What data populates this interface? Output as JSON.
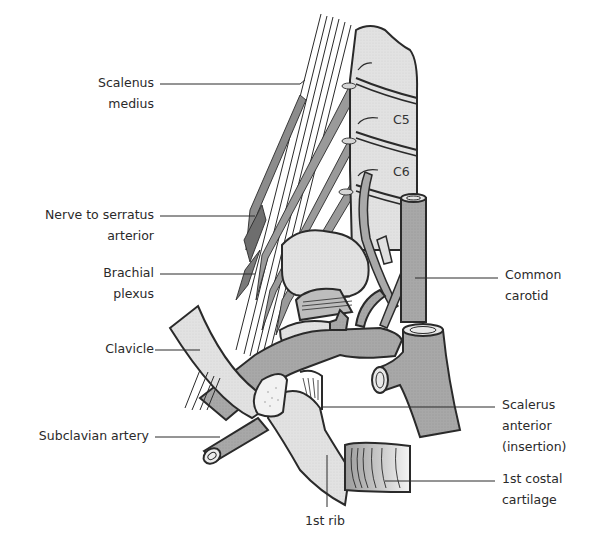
{
  "figure": {
    "type": "anatomical-illustration",
    "colors": {
      "background": "#ffffff",
      "outline": "#2a2a2a",
      "bone_fill": "#e3e3e3",
      "vessel_fill": "#a9a9a9",
      "muscle_fill": "#c8c8c8",
      "text": "#2a2a2a"
    }
  },
  "vertebra_labels": {
    "c5": "C5",
    "c6": "C6"
  },
  "labels_left": [
    {
      "id": "scalenus-medius",
      "lines": [
        "Scalenus",
        "medius"
      ]
    },
    {
      "id": "nerve-to-serratus",
      "lines": [
        "Nerve to serratus",
        "arterior"
      ]
    },
    {
      "id": "brachial-plexus",
      "lines": [
        "Brachial",
        "plexus"
      ]
    },
    {
      "id": "clavicle",
      "lines": [
        "Clavicle"
      ]
    },
    {
      "id": "subclavian-artery",
      "lines": [
        "Subclavian artery"
      ]
    }
  ],
  "labels_right": [
    {
      "id": "common-carotid",
      "lines": [
        "Common",
        "carotid"
      ]
    },
    {
      "id": "scalenus-anterior",
      "lines": [
        "Scalerus",
        "anterior",
        "(insertion)"
      ]
    },
    {
      "id": "first-costal-cartilage",
      "lines": [
        "1st costal",
        "cartilage"
      ]
    }
  ],
  "labels_bottom": [
    {
      "id": "first-rib",
      "lines": [
        "1st rib"
      ]
    }
  ]
}
